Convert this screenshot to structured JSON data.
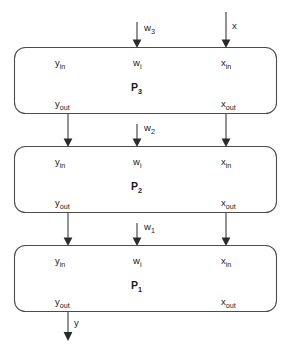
{
  "diagram": {
    "type": "block-diagram",
    "stroke_color": "#4c4c4c",
    "arrow_color": "#2b2b2b",
    "background_color": "#ffffff",
    "blocks": [
      {
        "id": "P3",
        "name": "P",
        "index": "3",
        "ports": {
          "y_in": {
            "base": "y",
            "sub": "in"
          },
          "w_i": {
            "base": "w",
            "sub": "i"
          },
          "x_in": {
            "base": "x",
            "sub": "in"
          },
          "y_out": {
            "base": "y",
            "sub": "out"
          },
          "x_out": {
            "base": "x",
            "sub": "out"
          }
        }
      },
      {
        "id": "P2",
        "name": "P",
        "index": "2",
        "ports": {
          "y_in": {
            "base": "y",
            "sub": "in"
          },
          "w_i": {
            "base": "w",
            "sub": "i"
          },
          "x_in": {
            "base": "x",
            "sub": "in"
          },
          "y_out": {
            "base": "y",
            "sub": "out"
          },
          "x_out": {
            "base": "x",
            "sub": "out"
          }
        }
      },
      {
        "id": "P1",
        "name": "P",
        "index": "1",
        "ports": {
          "y_in": {
            "base": "y",
            "sub": "in"
          },
          "w_i": {
            "base": "w",
            "sub": "i"
          },
          "x_in": {
            "base": "x",
            "sub": "in"
          },
          "y_out": {
            "base": "y",
            "sub": "out"
          },
          "x_out": {
            "base": "x",
            "sub": "out"
          }
        }
      }
    ],
    "signals": {
      "weight_3": {
        "base": "w",
        "sub": "3"
      },
      "weight_2": {
        "base": "w",
        "sub": "2"
      },
      "weight_1": {
        "base": "w",
        "sub": "1"
      },
      "input_x": "x",
      "output_y": "y"
    }
  }
}
